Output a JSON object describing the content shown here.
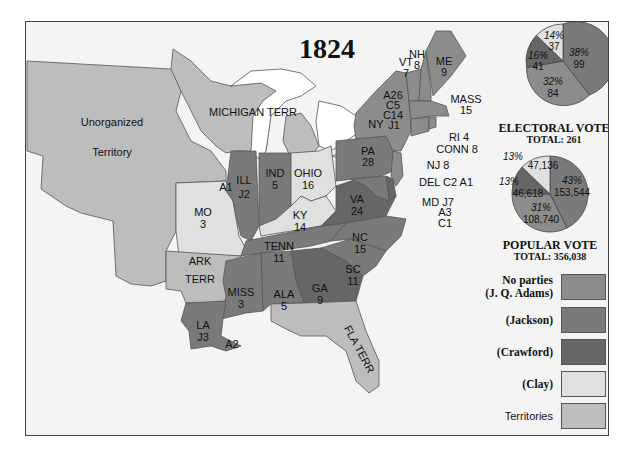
{
  "title": "1824",
  "colors": {
    "adams": "#8c8c8c",
    "jackson": "#7a7a7a",
    "crawford": "#666666",
    "clay": "#e0e0e0",
    "territories": "#bdbdbd",
    "water": "#ffffff",
    "foreign": "#f4f4f4"
  },
  "map_labels": {
    "unorganized_1": "Unorganized",
    "unorganized_2": "Territory",
    "michigan": "MICHIGAN TERR",
    "vt_name": "VT",
    "vt_votes": "7",
    "nh_name": "NH",
    "nh_votes": "8",
    "me_name": "ME",
    "me_votes": "9",
    "mass_name": "MASS",
    "mass_votes": "15",
    "ri": "RI 4",
    "conn": "CONN 8",
    "ny_split_1": "A26",
    "ny_split_2": "C5",
    "ny_split_3": "C14",
    "ny_split_4": "J1",
    "ny_name": "NY",
    "pa_name": "PA",
    "pa_votes": "28",
    "nj": "NJ 8",
    "del": "DEL C2 A1",
    "md_1": "MD J7",
    "md_2": "A3",
    "md_3": "C1",
    "ohio_name": "OHIO",
    "ohio_votes": "16",
    "ind_name": "IND",
    "ind_votes": "5",
    "ill_name": "ILL",
    "ill_votes": "J2",
    "ill_a": "A1",
    "mo_name": "MO",
    "mo_votes": "3",
    "ky_name": "KY",
    "ky_votes": "14",
    "va_name": "VA",
    "va_votes": "24",
    "nc_name": "NC",
    "nc_votes": "15",
    "sc_name": "SC",
    "sc_votes": "11",
    "tenn_name": "TENN",
    "tenn_votes": "11",
    "ga_name": "GA",
    "ga_votes": "9",
    "ala_name": "ALA",
    "ala_votes": "5",
    "miss_name": "MISS",
    "miss_votes": "3",
    "la_name": "LA",
    "la_votes": "J3",
    "la_a": "A2",
    "ark_1": "ARK",
    "ark_2": "TERR",
    "fla": "FLA TERR"
  },
  "electoral": {
    "title": "ELECTORAL VOTE",
    "total": "TOTAL: 261",
    "slices": [
      {
        "candidate": "Jackson",
        "pct": "38%",
        "value": "99"
      },
      {
        "candidate": "J. Q. Adams",
        "pct": "32%",
        "value": "84"
      },
      {
        "candidate": "Crawford",
        "pct": "16%",
        "value": "41"
      },
      {
        "candidate": "Clay",
        "pct": "14%",
        "value": "37"
      }
    ]
  },
  "popular": {
    "title": "POPULAR VOTE",
    "total": "TOTAL: 356,038",
    "slices": [
      {
        "candidate": "Jackson",
        "pct": "43%",
        "value": "153,544"
      },
      {
        "candidate": "J. Q. Adams",
        "pct": "31%",
        "value": "108,740"
      },
      {
        "candidate": "Crawford",
        "pct": "13%",
        "value": "46,618"
      },
      {
        "candidate": "Clay",
        "pct": "13%",
        "value": "47,136"
      }
    ]
  },
  "legend": [
    {
      "label_1": "No parties",
      "label_2": "(J. Q. Adams)",
      "key": "adams"
    },
    {
      "label_1": "(Jackson)",
      "key": "jackson"
    },
    {
      "label_1": "(Crawford)",
      "key": "crawford"
    },
    {
      "label_1": "(Clay)",
      "key": "clay"
    },
    {
      "label_1": "Territories",
      "key": "territories"
    }
  ]
}
